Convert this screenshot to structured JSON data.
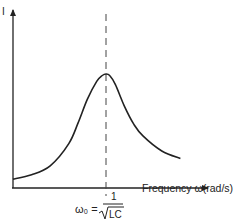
{
  "chart_data": {
    "type": "line",
    "title": "",
    "xlabel": "Frequency ω(rad/s)",
    "ylabel": "I",
    "xlim": [
      0,
      1
    ],
    "ylim": [
      0,
      1
    ],
    "grid": false,
    "legend": "none",
    "series": [
      {
        "name": "resonance-curve",
        "x": [
          0.0,
          0.1,
          0.2,
          0.3,
          0.35,
          0.4,
          0.45,
          0.48,
          0.5,
          0.52,
          0.55,
          0.6,
          0.65,
          0.7,
          0.8,
          0.9
        ],
        "y": [
          0.06,
          0.09,
          0.15,
          0.3,
          0.44,
          0.6,
          0.72,
          0.76,
          0.77,
          0.76,
          0.7,
          0.55,
          0.43,
          0.35,
          0.25,
          0.2
        ]
      }
    ],
    "annotations": [
      {
        "type": "vline",
        "x": 0.5,
        "style": "dashed",
        "label_prefix": "ω₀ =",
        "label_numerator": "1",
        "label_denominator": "LC"
      }
    ]
  },
  "colors": {
    "ink": "#222222",
    "background": "#ffffff"
  }
}
